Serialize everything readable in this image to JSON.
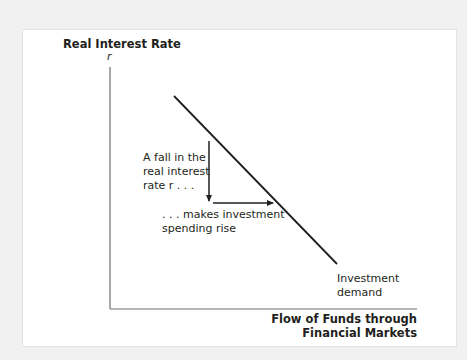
{
  "diagram": {
    "y_axis_label": "Real Interest Rate",
    "y_axis_symbol": "r",
    "x_axis_label_line1": "Flow of Funds through",
    "x_axis_label_line2": "Financial Markets",
    "curve_label_line1": "Investment",
    "curve_label_line2": "demand",
    "annotation_fall_line1": "A fall in the",
    "annotation_fall_line2": "real interest",
    "annotation_fall_line3": "rate r . . .",
    "annotation_rise_line1": ". . . makes investment",
    "annotation_rise_line2": "spending rise",
    "colors": {
      "background": "#f1f1f1",
      "panel": "#ffffff",
      "axis": "#6d6e71",
      "curve": "#231f20",
      "text": "#231f20"
    }
  }
}
